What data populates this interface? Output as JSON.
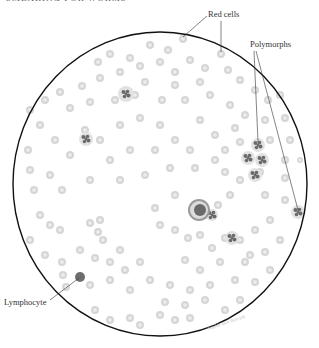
{
  "header": {
    "text": "Smearing for worms"
  },
  "figure": {
    "type": "blood-smear-microscope-field",
    "circle": {
      "cx": 160,
      "cy": 184,
      "rx": 147,
      "ry": 152,
      "stroke": "#111111"
    },
    "colors": {
      "red_cell_fill": "#d6d6d6",
      "red_cell_center": "#eeeeee",
      "nucleus": "#6a6a6a",
      "lymphocyte": "#6e6e6e",
      "leader_line": "#333333"
    }
  },
  "labels": {
    "red_cells": {
      "text": "Red cells",
      "x": 208,
      "y": 17
    },
    "polymorphs": {
      "text": "Polymorphs",
      "x": 250,
      "y": 47
    },
    "lymphocyte": {
      "text": "Lymphocyte",
      "x": 4,
      "y": 305
    }
  },
  "leaders": [
    {
      "name": "red-cells-leader-1",
      "x1": 207,
      "y1": 16,
      "x2": 183,
      "y2": 37
    },
    {
      "name": "red-cells-leader-2",
      "x1": 221,
      "y1": 21,
      "x2": 221,
      "y2": 52
    },
    {
      "name": "polymorphs-leader-1",
      "x1": 254,
      "y1": 51,
      "x2": 258,
      "y2": 142
    },
    {
      "name": "polymorphs-leader-2",
      "x1": 256,
      "y1": 51,
      "x2": 298,
      "y2": 210
    },
    {
      "name": "lymphocyte-leader",
      "x1": 50,
      "y1": 300,
      "x2": 79,
      "y2": 278
    }
  ],
  "signature": {
    "text": "Sophie ann Norrish",
    "x": 208,
    "y": 330
  },
  "cells": {
    "red": [
      [
        183,
        39,
        4
      ],
      [
        150,
        45,
        4
      ],
      [
        168,
        50,
        4
      ],
      [
        221,
        54,
        4
      ],
      [
        110,
        54,
        4
      ],
      [
        130,
        58,
        4
      ],
      [
        98,
        62,
        4
      ],
      [
        160,
        62,
        4
      ],
      [
        140,
        66,
        4
      ],
      [
        190,
        60,
        4
      ],
      [
        205,
        68,
        4
      ],
      [
        175,
        72,
        4
      ],
      [
        120,
        72,
        4
      ],
      [
        100,
        78,
        4
      ],
      [
        82,
        86,
        4
      ],
      [
        145,
        82,
        4
      ],
      [
        175,
        85,
        4
      ],
      [
        200,
        82,
        4
      ],
      [
        228,
        70,
        4
      ],
      [
        240,
        80,
        4
      ],
      [
        255,
        90,
        4
      ],
      [
        268,
        100,
        4
      ],
      [
        280,
        95,
        4
      ],
      [
        60,
        92,
        4
      ],
      [
        45,
        100,
        4
      ],
      [
        30,
        110,
        4
      ],
      [
        70,
        108,
        4
      ],
      [
        90,
        102,
        4
      ],
      [
        115,
        100,
        4
      ],
      [
        135,
        95,
        4
      ],
      [
        162,
        100,
        4
      ],
      [
        185,
        100,
        4
      ],
      [
        210,
        95,
        4
      ],
      [
        230,
        105,
        4
      ],
      [
        245,
        115,
        4
      ],
      [
        265,
        120,
        4
      ],
      [
        285,
        118,
        4
      ],
      [
        40,
        125,
        4
      ],
      [
        55,
        140,
        4
      ],
      [
        85,
        130,
        4
      ],
      [
        100,
        140,
        4
      ],
      [
        120,
        125,
        4
      ],
      [
        140,
        118,
        4
      ],
      [
        160,
        125,
        4
      ],
      [
        175,
        140,
        4
      ],
      [
        200,
        120,
        4
      ],
      [
        215,
        135,
        4
      ],
      [
        235,
        128,
        4
      ],
      [
        240,
        142,
        4
      ],
      [
        270,
        140,
        4
      ],
      [
        290,
        140,
        4
      ],
      [
        28,
        150,
        4
      ],
      [
        70,
        155,
        4
      ],
      [
        110,
        160,
        4
      ],
      [
        130,
        150,
        4
      ],
      [
        155,
        150,
        4
      ],
      [
        190,
        150,
        4
      ],
      [
        215,
        160,
        4
      ],
      [
        225,
        150,
        4
      ],
      [
        285,
        160,
        4
      ],
      [
        300,
        160,
        3
      ],
      [
        30,
        170,
        4
      ],
      [
        50,
        175,
        4
      ],
      [
        34,
        190,
        4
      ],
      [
        62,
        190,
        4
      ],
      [
        90,
        180,
        4
      ],
      [
        120,
        180,
        4
      ],
      [
        145,
        175,
        4
      ],
      [
        170,
        168,
        4
      ],
      [
        195,
        168,
        4
      ],
      [
        225,
        172,
        4
      ],
      [
        240,
        180,
        4
      ],
      [
        260,
        172,
        4
      ],
      [
        285,
        178,
        4
      ],
      [
        40,
        215,
        4
      ],
      [
        50,
        225,
        4
      ],
      [
        60,
        230,
        4
      ],
      [
        90,
        223,
        4
      ],
      [
        100,
        220,
        4
      ],
      [
        98,
        232,
        4
      ],
      [
        103,
        240,
        4
      ],
      [
        155,
        208,
        4
      ],
      [
        175,
        195,
        4
      ],
      [
        205,
        215,
        4
      ],
      [
        218,
        205,
        4
      ],
      [
        230,
        195,
        4
      ],
      [
        265,
        195,
        4
      ],
      [
        285,
        200,
        4
      ],
      [
        160,
        225,
        4
      ],
      [
        175,
        230,
        4
      ],
      [
        188,
        238,
        4
      ],
      [
        200,
        235,
        4
      ],
      [
        212,
        248,
        4
      ],
      [
        225,
        238,
        4
      ],
      [
        240,
        240,
        4
      ],
      [
        255,
        230,
        4
      ],
      [
        270,
        220,
        4
      ],
      [
        30,
        240,
        4
      ],
      [
        45,
        255,
        4
      ],
      [
        62,
        262,
        4
      ],
      [
        80,
        250,
        4
      ],
      [
        95,
        258,
        4
      ],
      [
        110,
        262,
        4
      ],
      [
        120,
        250,
        4
      ],
      [
        125,
        270,
        4
      ],
      [
        140,
        262,
        4
      ],
      [
        185,
        260,
        4
      ],
      [
        200,
        270,
        4
      ],
      [
        220,
        262,
        4
      ],
      [
        245,
        262,
        4
      ],
      [
        265,
        252,
        4
      ],
      [
        280,
        240,
        4
      ],
      [
        63,
        275,
        4
      ],
      [
        66,
        287,
        4
      ],
      [
        90,
        285,
        4
      ],
      [
        110,
        280,
        4
      ],
      [
        130,
        290,
        4
      ],
      [
        150,
        280,
        4
      ],
      [
        170,
        285,
        4
      ],
      [
        190,
        290,
        4
      ],
      [
        210,
        285,
        4
      ],
      [
        235,
        280,
        4
      ],
      [
        255,
        282,
        4
      ],
      [
        270,
        270,
        4
      ],
      [
        165,
        302,
        4
      ],
      [
        185,
        305,
        4
      ],
      [
        205,
        300,
        4
      ],
      [
        160,
        315,
        4
      ],
      [
        175,
        320,
        4
      ],
      [
        190,
        318,
        4
      ],
      [
        130,
        318,
        4
      ],
      [
        140,
        325,
        4
      ],
      [
        110,
        320,
        4
      ],
      [
        95,
        310,
        4
      ],
      [
        240,
        300,
        4
      ],
      [
        225,
        310,
        4
      ],
      [
        250,
        255,
        4
      ]
    ],
    "polymorphs": [
      [
        126,
        94,
        8
      ],
      [
        86,
        139,
        7
      ],
      [
        258,
        145,
        7
      ],
      [
        248,
        158,
        7
      ],
      [
        262,
        160,
        7
      ],
      [
        255,
        175,
        7
      ],
      [
        298,
        212,
        7
      ],
      [
        232,
        238,
        7
      ],
      [
        212,
        215,
        6
      ]
    ],
    "large_cell": [
      199,
      210,
      11
    ],
    "lymphocyte": [
      80,
      277,
      5
    ]
  }
}
